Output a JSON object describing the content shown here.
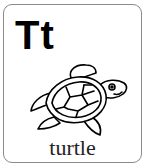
{
  "card": {
    "letters": "Tt",
    "word": "turtle",
    "illustration": "turtle-icon",
    "colors": {
      "border": "#8a8a8a",
      "ink": "#000000",
      "background": "#ffffff"
    }
  }
}
